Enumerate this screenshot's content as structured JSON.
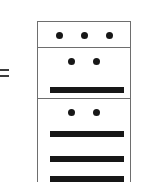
{
  "figure": {
    "name": "stacked-cells-diagram",
    "background_color": "#ffffff",
    "stroke_color": "#6e6e6e",
    "mark_color": "#171717",
    "equals": {
      "label": "=",
      "stroke_color": "#3c3c3c",
      "stroke_count": 2
    },
    "cells": [
      {
        "index": 1,
        "name": "cell-top",
        "dot_count": 3,
        "bar_count": 0,
        "dots": [
          "dot",
          "dot",
          "dot"
        ],
        "bars": []
      },
      {
        "index": 2,
        "name": "cell-middle",
        "dot_count": 2,
        "bar_count": 1,
        "dots": [
          "dot",
          "dot"
        ],
        "bars": [
          "bar"
        ]
      },
      {
        "index": 3,
        "name": "cell-bottom",
        "dot_count": 2,
        "bar_count": 3,
        "dots": [
          "dot",
          "dot"
        ],
        "bars": [
          "bar",
          "bar",
          "bar"
        ]
      }
    ]
  }
}
